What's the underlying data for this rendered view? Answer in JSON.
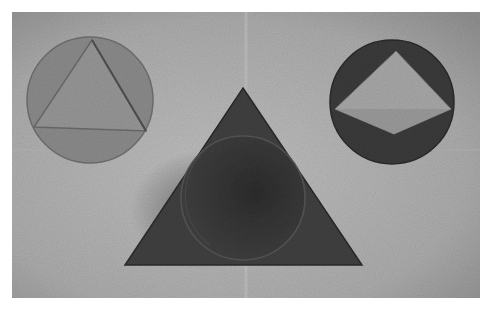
{
  "image": {
    "description": "Grayscale photograph of paper geometric cutouts: circle with inscribed triangle, triangle with inscribed circle, circle with inscribed diamond",
    "colors": {
      "paper": "#a9a9a9",
      "paper_light": "#bdbdbd",
      "left_circle": "#8a8a8a",
      "left_triangle": "#959595",
      "center_triangle": "#3e3e3e",
      "center_circle": "#353535",
      "right_circle": "#3a3a3a",
      "right_diamond": "#a6a6a6",
      "border": "#ffffff"
    },
    "shapes": [
      {
        "name": "left-circle-with-triangle",
        "type": "circle+triangle"
      },
      {
        "name": "center-triangle-with-circle",
        "type": "triangle+circle"
      },
      {
        "name": "right-circle-with-diamond",
        "type": "circle+diamond"
      }
    ]
  }
}
